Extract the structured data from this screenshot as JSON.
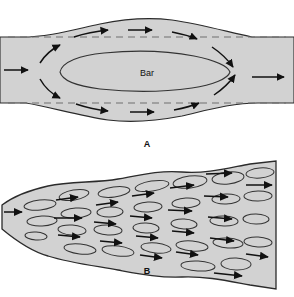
{
  "figure": {
    "width": 294,
    "height": 297,
    "background_color": "#ffffff",
    "channel_fill_color": "#d2d2d2",
    "outline_color": "#2b2b2b",
    "arrow_color": "#111111",
    "dashed_line_color": "#6e6e6e",
    "bar_outline_color": "#333333"
  },
  "panels": [
    {
      "id": "panel-a",
      "label": "A",
      "label_x": 147,
      "label_y": 144,
      "description": "Channel expansion with a single medial bar and diverging flow",
      "feature_labels": [
        {
          "text": "Bar",
          "x": 147,
          "y": 73
        }
      ],
      "channel_outline": "M 0,37 L 22,37 C 48,37 72,30 100,24 C 124,19 148,17 172,20 C 200,24 228,32 252,37 L 294,37 L 294,103 L 258,103 C 232,103 208,110 182,116 C 156,121 132,123 108,120 C 80,116 50,107 26,103 L 0,103 Z",
      "dashed_lines": [
        {
          "x1": 8,
          "y1": 37,
          "x2": 286,
          "y2": 37
        },
        {
          "x1": 8,
          "y1": 103,
          "x2": 286,
          "y2": 103
        }
      ],
      "bar_outline": "M 60,72 C 62,62 80,55 104,53 C 134,50 168,51 194,56 C 214,60 228,66 230,72 C 228,79 212,85 192,88 C 164,92 128,92 100,89 C 76,86 62,80 60,72 Z",
      "arrows": [
        {
          "id": "inlet",
          "path": "M 4,70 L 34,70",
          "head": "right"
        },
        {
          "id": "upper-divert-1",
          "path": "M 38,63 C 44,54 52,48 62,44",
          "head": "upright"
        },
        {
          "id": "upper-flow-1",
          "path": "M 72,37 C 86,33 100,31 112,30",
          "head": "right"
        },
        {
          "id": "upper-flow-2",
          "path": "M 126,30 L 156,30",
          "head": "right"
        },
        {
          "id": "upper-flow-3",
          "path": "M 170,32 C 182,34 192,37 200,40",
          "head": "rightdown"
        },
        {
          "id": "upper-converge",
          "path": "M 212,46 C 222,52 230,60 236,68",
          "head": "downright"
        },
        {
          "id": "outlet",
          "path": "M 250,77 L 288,77",
          "head": "right"
        },
        {
          "id": "lower-divert-1",
          "path": "M 38,79 C 44,88 52,95 62,99",
          "head": "downright"
        },
        {
          "id": "lower-flow-1",
          "path": "M 74,104 C 88,108 100,110 112,111",
          "head": "right"
        },
        {
          "id": "lower-flow-2",
          "path": "M 128,112 L 158,112",
          "head": "right"
        },
        {
          "id": "lower-flow-3",
          "path": "M 172,110 C 184,108 194,105 202,102",
          "head": "rightup"
        },
        {
          "id": "lower-converge",
          "path": "M 214,96 C 224,90 232,82 238,74",
          "head": "upright"
        }
      ]
    },
    {
      "id": "panel-b",
      "label": "B",
      "label_x": 147,
      "label_y": 271,
      "description": "Downstream-widening braided channel filled with numerous small elongate bars",
      "channel_outline": "M 2,205 C 14,196 30,190 48,186 C 70,181 96,183 118,179 C 140,175 160,170 182,172 C 206,174 228,168 250,164 L 276,161 L 276,289 L 250,285 C 228,281 206,276 182,277 C 160,278 140,274 118,270 C 96,266 70,263 48,256 C 30,251 14,239 2,229 Z",
      "bars": [
        {
          "cx": 40,
          "cy": 205,
          "rx": 16,
          "ry": 5,
          "rot": -6
        },
        {
          "cx": 42,
          "cy": 221,
          "rx": 15,
          "ry": 5,
          "rot": -3
        },
        {
          "cx": 36,
          "cy": 236,
          "rx": 11,
          "ry": 4,
          "rot": 4
        },
        {
          "cx": 74,
          "cy": 195,
          "rx": 15,
          "ry": 5,
          "rot": -10
        },
        {
          "cx": 76,
          "cy": 213,
          "rx": 15,
          "ry": 5,
          "rot": -4
        },
        {
          "cx": 72,
          "cy": 230,
          "rx": 14,
          "ry": 5,
          "rot": 4
        },
        {
          "cx": 80,
          "cy": 249,
          "rx": 16,
          "ry": 5,
          "rot": 6
        },
        {
          "cx": 114,
          "cy": 192,
          "rx": 16,
          "ry": 5,
          "rot": -8
        },
        {
          "cx": 110,
          "cy": 212,
          "rx": 13,
          "ry": 5,
          "rot": -2
        },
        {
          "cx": 108,
          "cy": 230,
          "rx": 14,
          "ry": 5,
          "rot": 3
        },
        {
          "cx": 118,
          "cy": 251,
          "rx": 16,
          "ry": 5,
          "rot": 7
        },
        {
          "cx": 152,
          "cy": 186,
          "rx": 17,
          "ry": 5,
          "rot": -9
        },
        {
          "cx": 148,
          "cy": 207,
          "rx": 14,
          "ry": 5,
          "rot": -3
        },
        {
          "cx": 146,
          "cy": 228,
          "rx": 13,
          "ry": 5,
          "rot": 2
        },
        {
          "cx": 156,
          "cy": 248,
          "rx": 15,
          "ry": 5,
          "rot": 6
        },
        {
          "cx": 190,
          "cy": 182,
          "rx": 17,
          "ry": 6,
          "rot": -7
        },
        {
          "cx": 186,
          "cy": 203,
          "rx": 14,
          "ry": 5,
          "rot": -3
        },
        {
          "cx": 184,
          "cy": 224,
          "rx": 13,
          "ry": 5,
          "rot": 3
        },
        {
          "cx": 192,
          "cy": 246,
          "rx": 16,
          "ry": 5,
          "rot": 5
        },
        {
          "cx": 198,
          "cy": 266,
          "rx": 17,
          "ry": 5,
          "rot": 3
        },
        {
          "cx": 228,
          "cy": 178,
          "rx": 16,
          "ry": 6,
          "rot": -6
        },
        {
          "cx": 226,
          "cy": 199,
          "rx": 14,
          "ry": 5,
          "rot": -2
        },
        {
          "cx": 224,
          "cy": 221,
          "rx": 14,
          "ry": 5,
          "rot": 2
        },
        {
          "cx": 228,
          "cy": 243,
          "rx": 15,
          "ry": 5,
          "rot": 4
        },
        {
          "cx": 236,
          "cy": 264,
          "rx": 15,
          "ry": 6,
          "rot": 2
        },
        {
          "cx": 260,
          "cy": 173,
          "rx": 14,
          "ry": 5,
          "rot": -5
        },
        {
          "cx": 258,
          "cy": 196,
          "rx": 14,
          "ry": 5,
          "rot": -1
        },
        {
          "cx": 256,
          "cy": 219,
          "rx": 13,
          "ry": 5,
          "rot": 1
        },
        {
          "cx": 258,
          "cy": 242,
          "rx": 14,
          "ry": 5,
          "rot": 3
        }
      ],
      "arrows": [
        {
          "id": "b-inlet",
          "path": "M 4,212 L 24,212",
          "head": "right"
        },
        {
          "id": "b-a1",
          "path": "M 56,200 L 82,197",
          "head": "right"
        },
        {
          "id": "b-a2",
          "path": "M 54,218 L 86,218",
          "head": "right"
        },
        {
          "id": "b-a3",
          "path": "M 58,235 L 84,237",
          "head": "right"
        },
        {
          "id": "b-a4",
          "path": "M 96,205 L 122,202",
          "head": "right"
        },
        {
          "id": "b-a5",
          "path": "M 94,222 L 120,224",
          "head": "right"
        },
        {
          "id": "b-a6",
          "path": "M 100,241 L 126,243",
          "head": "right"
        },
        {
          "id": "b-a7",
          "path": "M 132,196 L 158,193",
          "head": "right"
        },
        {
          "id": "b-a8",
          "path": "M 130,216 L 156,218",
          "head": "right"
        },
        {
          "id": "b-a9",
          "path": "M 136,236 L 162,238",
          "head": "right"
        },
        {
          "id": "b-a10",
          "path": "M 140,255 L 166,258",
          "head": "right"
        },
        {
          "id": "b-a11",
          "path": "M 170,188 L 198,185",
          "head": "right"
        },
        {
          "id": "b-a12",
          "path": "M 168,210 L 196,211",
          "head": "right"
        },
        {
          "id": "b-a13",
          "path": "M 172,231 L 198,233",
          "head": "right"
        },
        {
          "id": "b-a14",
          "path": "M 176,252 L 202,255",
          "head": "right"
        },
        {
          "id": "b-a15",
          "path": "M 206,174 L 236,173",
          "head": "right"
        },
        {
          "id": "b-a16",
          "path": "M 204,196 L 232,197",
          "head": "right"
        },
        {
          "id": "b-a17",
          "path": "M 208,217 L 236,219",
          "head": "right"
        },
        {
          "id": "b-a18",
          "path": "M 210,238 L 238,241",
          "head": "right"
        },
        {
          "id": "b-a19",
          "path": "M 214,273 L 246,276",
          "head": "right"
        },
        {
          "id": "b-a20",
          "path": "M 246,185 L 276,185",
          "head": "right"
        },
        {
          "id": "b-a21",
          "path": "M 246,254 L 272,257",
          "head": "right"
        }
      ]
    }
  ]
}
